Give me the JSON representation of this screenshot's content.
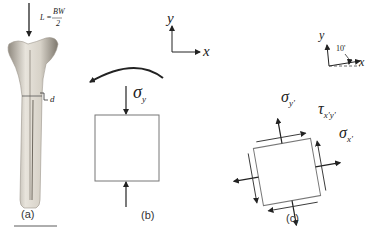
{
  "panel_a": {
    "load_label": "L =",
    "load_numerator": "BW",
    "load_denominator": "2",
    "depth_label": "d",
    "caption": "(a)"
  },
  "panel_b": {
    "axis_y": "y",
    "axis_x": "x",
    "stress_symbol": "σ",
    "stress_subscript": "y",
    "caption": "(b)"
  },
  "panel_c": {
    "axis_y": "y",
    "axis_x": "x",
    "angle_label": "10'",
    "normal_y_symbol": "σ",
    "normal_y_subscript": "y'",
    "shear_symbol": "τ",
    "shear_subscript": "x'y'",
    "normal_x_symbol": "σ",
    "normal_x_subscript": "x'",
    "caption": "(c)"
  },
  "colors": {
    "line": "#222222",
    "box": "#777777",
    "bone_light": "#e6e2da",
    "bone_shade": "#a39d93"
  }
}
